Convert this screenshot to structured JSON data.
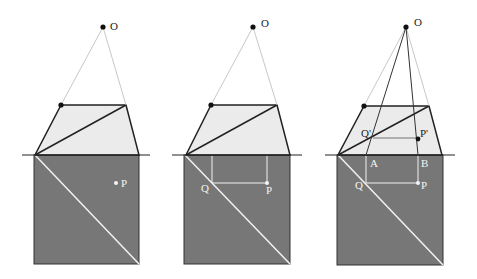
{
  "colors": {
    "ground": "#777777",
    "picture_plane": "#ebebeb",
    "edge": "#222222",
    "sight_line": "#c8c8c8",
    "construction": "#f2f2f2",
    "label_dark": "#222222",
    "label_light": "#f5f5f5"
  },
  "panels": [
    {
      "id": "panel-1",
      "labels": {
        "O": "O",
        "P": "P"
      }
    },
    {
      "id": "panel-2",
      "labels": {
        "O": "O",
        "Q": "Q",
        "P": "P"
      }
    },
    {
      "id": "panel-3",
      "labels": {
        "O": "O",
        "Qp": "Q'",
        "Pp": "P'",
        "A": "A",
        "B": "B",
        "Q": "Q",
        "P": "P"
      }
    }
  ]
}
